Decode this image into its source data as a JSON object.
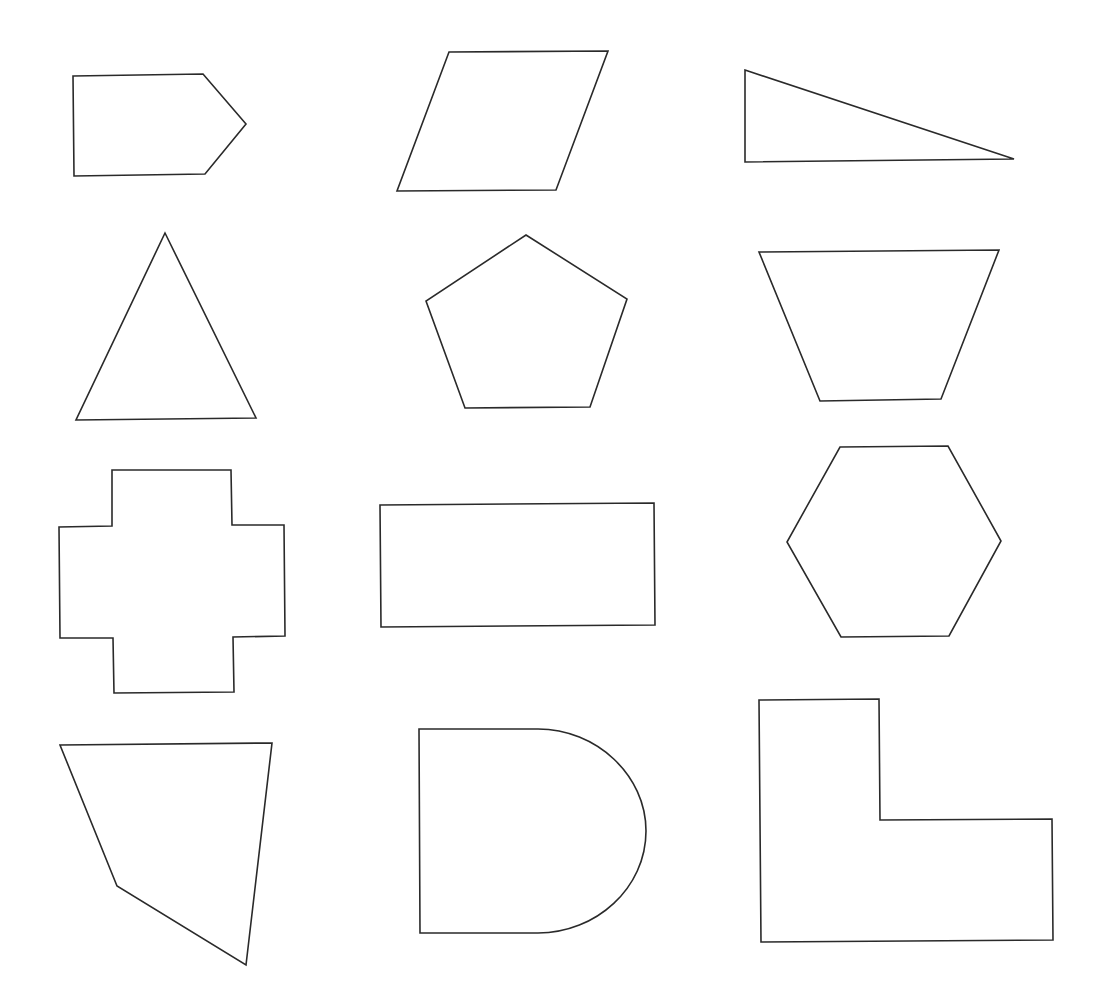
{
  "canvas": {
    "width": 1098,
    "height": 1008,
    "background": "#ffffff"
  },
  "style": {
    "stroke_color": "#2a2a2a",
    "stroke_width": 1.6
  },
  "shapes": [
    {
      "name": "arrow-pentagon",
      "type": "polygon",
      "points": [
        [
          73,
          76
        ],
        [
          203,
          74
        ],
        [
          246,
          124
        ],
        [
          205,
          174
        ],
        [
          74,
          176
        ]
      ]
    },
    {
      "name": "parallelogram",
      "type": "polygon",
      "points": [
        [
          449,
          52
        ],
        [
          608,
          51
        ],
        [
          556,
          190
        ],
        [
          397,
          191
        ]
      ]
    },
    {
      "name": "right-triangle",
      "type": "polygon",
      "points": [
        [
          745,
          70
        ],
        [
          1014,
          159
        ],
        [
          745,
          162
        ]
      ]
    },
    {
      "name": "isosceles-triangle",
      "type": "polygon",
      "points": [
        [
          165,
          233
        ],
        [
          256,
          418
        ],
        [
          76,
          420
        ]
      ]
    },
    {
      "name": "regular-pentagon",
      "type": "polygon",
      "points": [
        [
          526,
          235
        ],
        [
          627,
          299
        ],
        [
          590,
          407
        ],
        [
          465,
          408
        ],
        [
          426,
          301
        ]
      ]
    },
    {
      "name": "trapezoid",
      "type": "polygon",
      "points": [
        [
          759,
          252
        ],
        [
          999,
          250
        ],
        [
          941,
          399
        ],
        [
          820,
          401
        ]
      ]
    },
    {
      "name": "cross",
      "type": "polygon",
      "points": [
        [
          112,
          470
        ],
        [
          231,
          470
        ],
        [
          232,
          525
        ],
        [
          284,
          525
        ],
        [
          285,
          636
        ],
        [
          233,
          637
        ],
        [
          234,
          692
        ],
        [
          114,
          693
        ],
        [
          113,
          638
        ],
        [
          60,
          638
        ],
        [
          59,
          527
        ],
        [
          112,
          526
        ]
      ]
    },
    {
      "name": "rectangle",
      "type": "polygon",
      "points": [
        [
          380,
          505
        ],
        [
          654,
          503
        ],
        [
          655,
          625
        ],
        [
          381,
          627
        ]
      ]
    },
    {
      "name": "hexagon",
      "type": "polygon",
      "points": [
        [
          840,
          447
        ],
        [
          948,
          446
        ],
        [
          1001,
          541
        ],
        [
          949,
          636
        ],
        [
          841,
          637
        ],
        [
          787,
          542
        ]
      ]
    },
    {
      "name": "irregular-quadrilateral",
      "type": "polygon",
      "points": [
        [
          60,
          745
        ],
        [
          272,
          743
        ],
        [
          246,
          965
        ],
        [
          117,
          886
        ]
      ]
    },
    {
      "name": "d-shape",
      "type": "path",
      "d": "M 419 729 L 538 729 C 596 729 646 775 646 831 C 646 888 596 933 538 933 L 420 933 Z"
    },
    {
      "name": "l-shape",
      "type": "polygon",
      "points": [
        [
          759,
          700
        ],
        [
          879,
          699
        ],
        [
          880,
          820
        ],
        [
          1052,
          819
        ],
        [
          1053,
          940
        ],
        [
          761,
          942
        ]
      ]
    }
  ]
}
